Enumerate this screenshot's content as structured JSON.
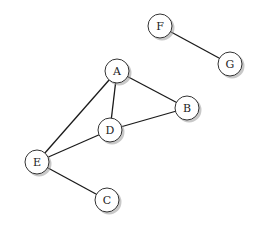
{
  "graph": {
    "nodes": [
      {
        "id": "A",
        "label": "A",
        "x": 117,
        "y": 71
      },
      {
        "id": "B",
        "label": "B",
        "x": 187,
        "y": 108
      },
      {
        "id": "C",
        "label": "C",
        "x": 107,
        "y": 200
      },
      {
        "id": "D",
        "label": "D",
        "x": 110,
        "y": 130
      },
      {
        "id": "E",
        "label": "E",
        "x": 37,
        "y": 162
      },
      {
        "id": "F",
        "label": "F",
        "x": 160,
        "y": 26
      },
      {
        "id": "G",
        "label": "G",
        "x": 230,
        "y": 64
      }
    ],
    "edges": [
      {
        "from": "F",
        "to": "G"
      },
      {
        "from": "A",
        "to": "B"
      },
      {
        "from": "A",
        "to": "D"
      },
      {
        "from": "A",
        "to": "E"
      },
      {
        "from": "D",
        "to": "B"
      },
      {
        "from": "D",
        "to": "E"
      },
      {
        "from": "E",
        "to": "C"
      }
    ],
    "node_radius": 12
  },
  "colors": {
    "background": "#ffffff",
    "edge": "#1a1a1a",
    "node_fill": "#ffffff",
    "node_stroke": "#333333",
    "shadow": "#9a9a9a"
  }
}
